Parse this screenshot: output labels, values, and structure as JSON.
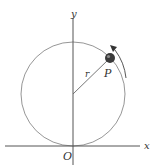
{
  "diagram": {
    "type": "circular-motion",
    "labels": {
      "y_axis": "y",
      "x_axis": "x",
      "origin": "O",
      "radius": "r",
      "point": "P"
    },
    "colors": {
      "axis": "#555555",
      "circle": "#8a8a8a",
      "radius_line": "#666666",
      "point": "#3a3a3a",
      "arrow": "#444444",
      "background": "#ffffff"
    },
    "geometry": {
      "circle_center": [
        73,
        94
      ],
      "circle_radius": 52,
      "point_position": [
        110,
        58
      ],
      "motion_direction": "counterclockwise"
    }
  }
}
